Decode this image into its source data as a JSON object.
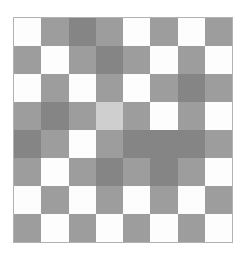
{
  "figure": {
    "background_color": "#ffffff",
    "border_color": "#b2b2b2"
  },
  "chart_data": {
    "type": "heatmap",
    "title": "",
    "subtitle": "",
    "xlabel": "",
    "ylabel": "",
    "grid": false,
    "legend": "none",
    "colormap": "grays",
    "rows": 8,
    "cols": 8,
    "x": [
      1,
      2,
      3,
      4,
      5,
      6,
      7,
      8
    ],
    "y": [
      1,
      2,
      3,
      4,
      5,
      6,
      7,
      8
    ],
    "xticklabels": [],
    "yticklabels": [],
    "value_levels": {
      "white": 1.0,
      "light": 0.82,
      "mid": 0.62,
      "dark": 0.52
    },
    "level_colors": {
      "white": "#fdfdfd",
      "light": "#cfcfcf",
      "mid": "#9d9d9d",
      "dark": "#858585"
    },
    "values": [
      [
        1.0,
        0.62,
        0.52,
        0.62,
        1.0,
        0.62,
        1.0,
        0.62
      ],
      [
        0.62,
        1.0,
        0.62,
        0.52,
        0.62,
        1.0,
        0.62,
        1.0
      ],
      [
        1.0,
        0.62,
        1.0,
        0.62,
        1.0,
        0.62,
        0.52,
        0.62
      ],
      [
        0.62,
        0.52,
        0.62,
        0.82,
        0.62,
        1.0,
        0.62,
        1.0
      ],
      [
        0.52,
        0.62,
        1.0,
        0.62,
        0.52,
        0.52,
        0.52,
        0.62
      ],
      [
        0.62,
        1.0,
        0.62,
        0.52,
        0.62,
        0.52,
        0.62,
        1.0
      ],
      [
        1.0,
        0.62,
        1.0,
        0.62,
        1.0,
        0.62,
        1.0,
        0.62
      ],
      [
        0.62,
        1.0,
        0.62,
        1.0,
        0.62,
        1.0,
        0.62,
        1.0
      ]
    ],
    "cell_colors": [
      [
        "#fdfdfd",
        "#9d9d9d",
        "#858585",
        "#9d9d9d",
        "#fdfdfd",
        "#9d9d9d",
        "#fdfdfd",
        "#9d9d9d"
      ],
      [
        "#9d9d9d",
        "#fdfdfd",
        "#9d9d9d",
        "#858585",
        "#9d9d9d",
        "#fdfdfd",
        "#9d9d9d",
        "#fdfdfd"
      ],
      [
        "#fdfdfd",
        "#9d9d9d",
        "#fdfdfd",
        "#9d9d9d",
        "#fdfdfd",
        "#9d9d9d",
        "#858585",
        "#9d9d9d"
      ],
      [
        "#9d9d9d",
        "#858585",
        "#9d9d9d",
        "#cfcfcf",
        "#9d9d9d",
        "#fdfdfd",
        "#9d9d9d",
        "#fdfdfd"
      ],
      [
        "#858585",
        "#9d9d9d",
        "#fdfdfd",
        "#9d9d9d",
        "#858585",
        "#858585",
        "#858585",
        "#9d9d9d"
      ],
      [
        "#9d9d9d",
        "#fdfdfd",
        "#9d9d9d",
        "#858585",
        "#9d9d9d",
        "#858585",
        "#9d9d9d",
        "#fdfdfd"
      ],
      [
        "#fdfdfd",
        "#9d9d9d",
        "#fdfdfd",
        "#9d9d9d",
        "#fdfdfd",
        "#9d9d9d",
        "#fdfdfd",
        "#9d9d9d"
      ],
      [
        "#9d9d9d",
        "#fdfdfd",
        "#9d9d9d",
        "#fdfdfd",
        "#9d9d9d",
        "#fdfdfd",
        "#9d9d9d",
        "#fdfdfd"
      ]
    ]
  }
}
